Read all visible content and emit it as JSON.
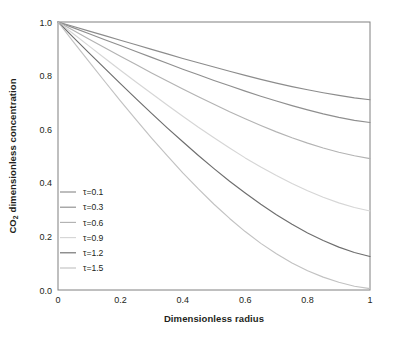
{
  "chart_data": {
    "type": "line",
    "title": "",
    "xlabel": "Dimensionless radius",
    "ylabel_prefix": "CO",
    "ylabel_subscript": "2",
    "ylabel_suffix": " dimensionless concentration",
    "xlim": [
      0,
      1
    ],
    "ylim": [
      0,
      1
    ],
    "xticks": [
      0,
      0.2,
      0.4,
      0.6,
      0.8,
      1
    ],
    "xticklabels": [
      "0",
      "0.2",
      "0.4",
      "0.6",
      "0.8",
      "1"
    ],
    "yticks": [
      0,
      0.2,
      0.4,
      0.6,
      0.8,
      1
    ],
    "yticklabels": [
      "0.0",
      "0.2",
      "0.4",
      "0.6",
      "0.8",
      "1.0"
    ],
    "grid": false,
    "legend_position": "lower-left-inside",
    "x": [
      0,
      0.05,
      0.1,
      0.15,
      0.2,
      0.25,
      0.3,
      0.35,
      0.4,
      0.45,
      0.5,
      0.55,
      0.6,
      0.65,
      0.7,
      0.75,
      0.8,
      0.85,
      0.9,
      0.95,
      1
    ],
    "series": [
      {
        "name": "τ=0.1",
        "tau": 0.1,
        "color": "#8c8c8c",
        "values": [
          1.0,
          0.983,
          0.966,
          0.949,
          0.932,
          0.915,
          0.898,
          0.881,
          0.864,
          0.848,
          0.832,
          0.816,
          0.801,
          0.786,
          0.772,
          0.759,
          0.747,
          0.736,
          0.726,
          0.717,
          0.71
        ]
      },
      {
        "name": "τ=0.3",
        "tau": 0.3,
        "color": "#8f8f8f",
        "values": [
          1.0,
          0.978,
          0.956,
          0.934,
          0.912,
          0.89,
          0.868,
          0.846,
          0.824,
          0.803,
          0.782,
          0.762,
          0.742,
          0.723,
          0.705,
          0.688,
          0.672,
          0.657,
          0.644,
          0.633,
          0.625
        ]
      },
      {
        "name": "τ=0.6",
        "tau": 0.6,
        "color": "#b3b3b3",
        "values": [
          1.0,
          0.968,
          0.936,
          0.904,
          0.872,
          0.841,
          0.81,
          0.78,
          0.75,
          0.721,
          0.693,
          0.665,
          0.639,
          0.614,
          0.59,
          0.568,
          0.548,
          0.53,
          0.514,
          0.501,
          0.49
        ]
      },
      {
        "name": "τ=0.9",
        "tau": 0.9,
        "color": "#d6d6d6",
        "values": [
          1.0,
          0.955,
          0.91,
          0.865,
          0.82,
          0.776,
          0.733,
          0.69,
          0.648,
          0.607,
          0.568,
          0.53,
          0.493,
          0.459,
          0.427,
          0.397,
          0.37,
          0.346,
          0.325,
          0.308,
          0.295
        ]
      },
      {
        "name": "τ=1.2",
        "tau": 1.2,
        "color": "#6e6e6e",
        "values": [
          1.0,
          0.942,
          0.884,
          0.827,
          0.77,
          0.714,
          0.659,
          0.605,
          0.553,
          0.502,
          0.453,
          0.406,
          0.362,
          0.32,
          0.281,
          0.245,
          0.213,
          0.185,
          0.16,
          0.14,
          0.125
        ]
      },
      {
        "name": "τ=1.5",
        "tau": 1.5,
        "color": "#c2c2c2",
        "values": [
          1.0,
          0.925,
          0.851,
          0.778,
          0.706,
          0.636,
          0.567,
          0.501,
          0.437,
          0.377,
          0.32,
          0.267,
          0.218,
          0.174,
          0.135,
          0.101,
          0.072,
          0.048,
          0.029,
          0.014,
          0.005
        ]
      }
    ]
  },
  "legend": {
    "entries": [
      {
        "label": "τ=0.1"
      },
      {
        "label": "τ=0.3"
      },
      {
        "label": "τ=0.6"
      },
      {
        "label": "τ=0.9"
      },
      {
        "label": "τ=1.2"
      },
      {
        "label": "τ=1.5"
      }
    ]
  },
  "axes": {
    "x_title": "Dimensionless radius",
    "y_title_prefix": "CO",
    "y_title_sub": "2",
    "y_title_rest": " dimensionless concentration",
    "x_tick_0": "0",
    "x_tick_1": "0.2",
    "x_tick_2": "0.4",
    "x_tick_3": "0.6",
    "x_tick_4": "0.8",
    "x_tick_5": "1",
    "y_tick_0": "0.0",
    "y_tick_1": "0.2",
    "y_tick_2": "0.4",
    "y_tick_3": "0.6",
    "y_tick_4": "0.8",
    "y_tick_5": "1.0"
  },
  "style": {
    "frame_color": "#808080",
    "text_color": "#231f20",
    "background": "#ffffff"
  }
}
